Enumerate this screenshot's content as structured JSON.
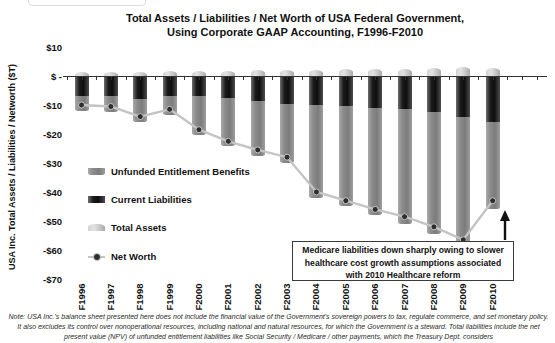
{
  "title": {
    "line1": "Total Assets / Liabilities / Net Worth of USA Federal Government,",
    "line2": "Using Corporate GAAP Accounting, F1996-F2010"
  },
  "y_axis": {
    "label": "USA Inc. Total Assets / Liabilities / Networth ($T)",
    "ticks": [
      {
        "label": "$10",
        "value": 10
      },
      {
        "label": "$ -",
        "value": 0
      },
      {
        "label": "-$10",
        "value": -10
      },
      {
        "label": "-$20",
        "value": -20
      },
      {
        "label": "-$30",
        "value": -30
      },
      {
        "label": "-$40",
        "value": -40
      },
      {
        "label": "-$50",
        "value": -50
      },
      {
        "label": "-$60",
        "value": -60
      },
      {
        "label": "-$70",
        "value": -70
      }
    ]
  },
  "chart_data": {
    "type": "bar",
    "stacked": true,
    "title": "Total Assets / Liabilities / Net Worth of USA Federal Government, Using Corporate GAAP Accounting, F1996-F2010",
    "ylabel": "USA Inc. Total Assets / Liabilities / Networth ($T)",
    "units": "$T",
    "ylim": [
      -70,
      10
    ],
    "grid": false,
    "legend_position": "middle-left inside plot",
    "categories": [
      "F1996",
      "F1997",
      "F1998",
      "F1999",
      "F2000",
      "F2001",
      "F2002",
      "F2003",
      "F2004",
      "F2005",
      "F2006",
      "F2007",
      "F2008",
      "F2009",
      "F2010"
    ],
    "series": [
      {
        "name": "Total Assets",
        "type": "bar",
        "values": [
          1.5,
          1.5,
          1.5,
          1.8,
          1.8,
          1.8,
          2.0,
          2.0,
          2.2,
          2.3,
          2.4,
          2.5,
          2.7,
          3.0,
          2.9
        ]
      },
      {
        "name": "Current Liabilities",
        "type": "bar",
        "values": [
          -7.0,
          -7.0,
          -8.0,
          -7.0,
          -7.0,
          -7.5,
          -8.5,
          -9.5,
          -10.0,
          -10.5,
          -11.0,
          -11.5,
          -12.5,
          -14.0,
          -16.0
        ]
      },
      {
        "name": "Unfunded Entitlement Benefits",
        "type": "bar",
        "values": [
          -5.0,
          -5.5,
          -8.0,
          -6.5,
          -13.5,
          -16.5,
          -19.0,
          -20.5,
          -32.0,
          -34.5,
          -37.0,
          -39.5,
          -42.0,
          -45.5,
          -30.0
        ]
      },
      {
        "name": "Net Worth",
        "type": "line",
        "values": [
          -10.0,
          -10.5,
          -14.0,
          -11.5,
          -18.5,
          -22.5,
          -25.5,
          -28.0,
          -40.0,
          -43.0,
          -46.0,
          -48.5,
          -52.0,
          -56.5,
          -43.0
        ]
      }
    ]
  },
  "legend": {
    "items": [
      {
        "label": "Unfunded Entitlement Benefits",
        "swatch": "unfunded"
      },
      {
        "label": "Current Liabilities",
        "swatch": "current"
      },
      {
        "label": "Total Assets",
        "swatch": "assets"
      },
      {
        "label": "Net Worth",
        "swatch": "line"
      }
    ]
  },
  "annotation": {
    "text": "Medicare liabilities down sharply owing to slower healthcare cost growth assumptions associated with 2010 Healthcare reform"
  },
  "note": "Note: USA Inc.'s balance sheet presented here does not include the financial value of the Government's sovereign powers to tax, regulate commerce, and set monetary policy. It also excludes its control over nonoperational resources, including national and natural resources, for which the Government is a steward. Total liabilities include the net present value (NPV) of unfunded entitlement liabilities like Social Security / Medicare / other payments, which the Treasury Dept. considers",
  "colors": {
    "total_assets": "#c9c9c9",
    "current_liabilities": "#1a1a1a",
    "unfunded_entitlement_benefits": "#8a8a8a",
    "net_worth_line": "#c4c4c4",
    "net_worth_dot": "#2d2d2d",
    "axis": "#333333",
    "text": "#111111"
  }
}
